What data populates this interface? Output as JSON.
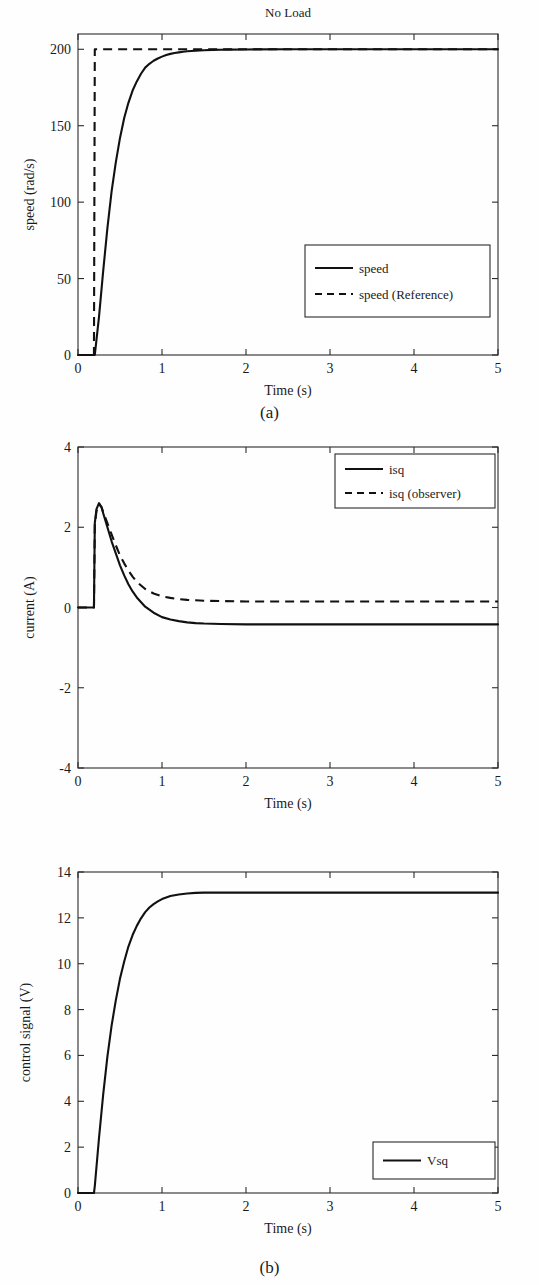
{
  "figure": {
    "panels": [
      {
        "caption": "(a)",
        "chart_data": {
          "type": "line",
          "title": "No Load",
          "xlabel": "Time (s)",
          "ylabel": "speed (rad/s)",
          "xlim": [
            0,
            5
          ],
          "ylim": [
            0,
            210
          ],
          "xticks": [
            0,
            1,
            2,
            3,
            4,
            5
          ],
          "xticklabels": [
            "0",
            "1",
            "2",
            "3",
            "4",
            "5"
          ],
          "yticks": [
            0,
            50,
            100,
            150,
            200
          ],
          "yticklabels": [
            "0",
            "50",
            "100",
            "150",
            "200"
          ],
          "grid": false,
          "legend_position": "center-right",
          "series": [
            {
              "name": "speed",
              "style": "solid",
              "x": [
                0,
                0.05,
                0.1,
                0.15,
                0.19,
                0.2,
                0.25,
                0.3,
                0.35,
                0.4,
                0.45,
                0.5,
                0.55,
                0.6,
                0.65,
                0.7,
                0.75,
                0.8,
                0.85,
                0.9,
                0.95,
                1.0,
                1.05,
                1.1,
                1.15,
                1.2,
                1.25,
                1.3,
                1.35,
                1.4,
                1.5,
                1.6,
                1.7,
                1.8,
                2.0,
                2.5,
                3.0,
                3.5,
                4.0,
                4.5,
                5.0
              ],
              "values": [
                0,
                0,
                0,
                0,
                0,
                0,
                25,
                55,
                83,
                107,
                126,
                142,
                155,
                165,
                173,
                179,
                184,
                188,
                190.5,
                192.5,
                194,
                195.2,
                196.2,
                197,
                197.6,
                198,
                198.4,
                198.7,
                198.9,
                199.1,
                199.4,
                199.6,
                199.7,
                199.8,
                199.9,
                200,
                200,
                200,
                200,
                200,
                200
              ]
            },
            {
              "name": "speed (Reference)",
              "style": "dashed",
              "x": [
                0,
                0.19,
                0.2,
                5
              ],
              "values": [
                0,
                0,
                200,
                200
              ]
            }
          ]
        }
      },
      {
        "caption": "",
        "chart_data": {
          "type": "line",
          "title": "",
          "xlabel": "Time (s)",
          "ylabel": "current (A)",
          "xlim": [
            0,
            5
          ],
          "ylim": [
            -4,
            4
          ],
          "xticks": [
            0,
            1,
            2,
            3,
            4,
            5
          ],
          "xticklabels": [
            "0",
            "1",
            "2",
            "3",
            "4",
            "5"
          ],
          "yticks": [
            -4,
            -2,
            0,
            2,
            4
          ],
          "yticklabels": [
            "-4",
            "-2",
            "0",
            "2",
            "4"
          ],
          "grid": false,
          "legend_position": "top-right",
          "series": [
            {
              "name": "isq",
              "style": "solid",
              "x": [
                0,
                0.19,
                0.2,
                0.22,
                0.25,
                0.28,
                0.3,
                0.35,
                0.4,
                0.45,
                0.5,
                0.55,
                0.6,
                0.65,
                0.7,
                0.8,
                0.9,
                1.0,
                1.1,
                1.2,
                1.3,
                1.4,
                1.5,
                1.7,
                2.0,
                2.5,
                3.0,
                3.5,
                4.0,
                4.5,
                5.0
              ],
              "values": [
                0,
                0,
                2.1,
                2.45,
                2.6,
                2.5,
                2.35,
                2.0,
                1.65,
                1.35,
                1.05,
                0.8,
                0.58,
                0.4,
                0.25,
                0.02,
                -0.13,
                -0.24,
                -0.3,
                -0.34,
                -0.37,
                -0.39,
                -0.4,
                -0.41,
                -0.42,
                -0.42,
                -0.42,
                -0.42,
                -0.42,
                -0.42,
                -0.42
              ]
            },
            {
              "name": "isq (observer)",
              "style": "dashed",
              "x": [
                0,
                0.19,
                0.2,
                0.22,
                0.25,
                0.28,
                0.3,
                0.35,
                0.4,
                0.45,
                0.5,
                0.55,
                0.6,
                0.65,
                0.7,
                0.8,
                0.9,
                1.0,
                1.1,
                1.2,
                1.3,
                1.4,
                1.5,
                1.7,
                2.0,
                2.5,
                3.0,
                3.5,
                4.0,
                4.5,
                5.0
              ],
              "values": [
                0,
                0,
                2.05,
                2.4,
                2.58,
                2.5,
                2.38,
                2.1,
                1.82,
                1.55,
                1.3,
                1.1,
                0.92,
                0.77,
                0.64,
                0.46,
                0.35,
                0.28,
                0.24,
                0.21,
                0.19,
                0.18,
                0.17,
                0.16,
                0.15,
                0.15,
                0.15,
                0.15,
                0.15,
                0.15,
                0.15
              ]
            }
          ]
        }
      },
      {
        "caption": "(b)",
        "chart_data": {
          "type": "line",
          "title": "",
          "xlabel": "Time (s)",
          "ylabel": "control signal (V)",
          "xlim": [
            0,
            5
          ],
          "ylim": [
            0,
            14
          ],
          "xticks": [
            0,
            1,
            2,
            3,
            4,
            5
          ],
          "xticklabels": [
            "0",
            "1",
            "2",
            "3",
            "4",
            "5"
          ],
          "yticks": [
            0,
            2,
            4,
            6,
            8,
            10,
            12,
            14
          ],
          "yticklabels": [
            "0",
            "2",
            "4",
            "6",
            "8",
            "10",
            "12",
            "14"
          ],
          "grid": false,
          "legend_position": "bottom-right",
          "series": [
            {
              "name": "Vsq",
              "style": "solid",
              "x": [
                0,
                0.19,
                0.2,
                0.25,
                0.3,
                0.35,
                0.4,
                0.45,
                0.5,
                0.55,
                0.6,
                0.65,
                0.7,
                0.75,
                0.8,
                0.85,
                0.9,
                0.95,
                1.0,
                1.1,
                1.2,
                1.3,
                1.4,
                1.5,
                1.6,
                1.8,
                2.0,
                2.5,
                3.0,
                3.5,
                4.0,
                4.5,
                5.0
              ],
              "values": [
                0,
                0,
                0.3,
                2.4,
                4.3,
                5.95,
                7.3,
                8.4,
                9.35,
                10.1,
                10.75,
                11.25,
                11.65,
                11.98,
                12.25,
                12.45,
                12.6,
                12.72,
                12.82,
                12.95,
                13.02,
                13.06,
                13.09,
                13.1,
                13.1,
                13.1,
                13.1,
                13.1,
                13.1,
                13.1,
                13.1,
                13.1,
                13.1
              ]
            }
          ]
        }
      }
    ]
  }
}
